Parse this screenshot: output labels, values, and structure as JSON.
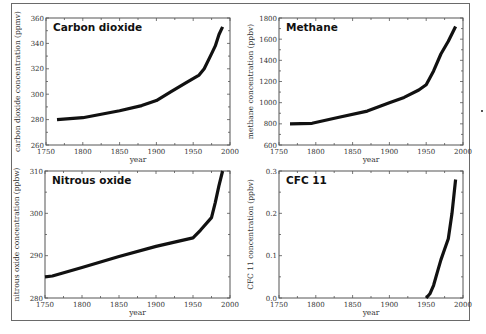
{
  "chart_data": [
    {
      "type": "line",
      "title": "Carbon dioxide",
      "xlabel": "year",
      "ylabel": "carbon dioxide concentration (ppmv)",
      "xlim": [
        1750,
        2000
      ],
      "ylim": [
        260,
        360
      ],
      "xticks": [
        1750,
        1800,
        1850,
        1900,
        1950,
        2000
      ],
      "yticks": [
        260,
        280,
        300,
        320,
        340,
        360
      ],
      "grid": false,
      "x": [
        1765,
        1800,
        1850,
        1880,
        1900,
        1920,
        1940,
        1958,
        1965,
        1975,
        1980,
        1985,
        1990
      ],
      "y": [
        280,
        281.5,
        287,
        291,
        295,
        302,
        309,
        315,
        320,
        332,
        338,
        347,
        353
      ]
    },
    {
      "type": "line",
      "title": "Methane",
      "xlabel": "year",
      "ylabel": "methane concentration (ppbv)",
      "xlim": [
        1750,
        2000
      ],
      "ylim": [
        600,
        1800
      ],
      "xticks": [
        1750,
        1800,
        1850,
        1900,
        1950,
        2000
      ],
      "yticks": [
        600,
        800,
        1000,
        1200,
        1400,
        1600,
        1800
      ],
      "grid": false,
      "x": [
        1765,
        1795,
        1830,
        1870,
        1900,
        1920,
        1940,
        1950,
        1960,
        1970,
        1980,
        1990
      ],
      "y": [
        800,
        805,
        860,
        920,
        1000,
        1050,
        1120,
        1170,
        1300,
        1460,
        1580,
        1720
      ]
    },
    {
      "type": "line",
      "title": "Nitrous oxide",
      "xlabel": "year",
      "ylabel": "nitrous oxide concentration (ppbw)",
      "xlim": [
        1750,
        2000
      ],
      "ylim": [
        280,
        310
      ],
      "xticks": [
        1750,
        1800,
        1850,
        1900,
        1950,
        2000
      ],
      "yticks": [
        280,
        290,
        300,
        310
      ],
      "grid": false,
      "x": [
        1750,
        1760,
        1800,
        1850,
        1900,
        1925,
        1950,
        1960,
        1975,
        1980,
        1985,
        1990
      ],
      "y": [
        285,
        285.2,
        287.2,
        289.8,
        292.2,
        293.2,
        294.2,
        296,
        299,
        302.5,
        306.5,
        310
      ]
    },
    {
      "type": "line",
      "title": "CFC 11",
      "xlabel": "year",
      "ylabel": "CFC 11 concentration (ppbv)",
      "xlim": [
        1750,
        2000
      ],
      "ylim": [
        0.0,
        0.3
      ],
      "xticks": [
        1750,
        1800,
        1850,
        1900,
        1950,
        2000
      ],
      "yticks": [
        0.0,
        0.1,
        0.2,
        0.3
      ],
      "ytick_labels": [
        "0.0",
        "0.1",
        "0.2",
        "0.3"
      ],
      "grid": false,
      "x": [
        1950,
        1955,
        1960,
        1965,
        1970,
        1975,
        1980,
        1985,
        1990
      ],
      "y": [
        0.0,
        0.01,
        0.03,
        0.06,
        0.09,
        0.115,
        0.14,
        0.2,
        0.28
      ]
    }
  ],
  "colors": {
    "line": "#111111",
    "axis": "#555555",
    "frame": "#6a6a6a"
  }
}
